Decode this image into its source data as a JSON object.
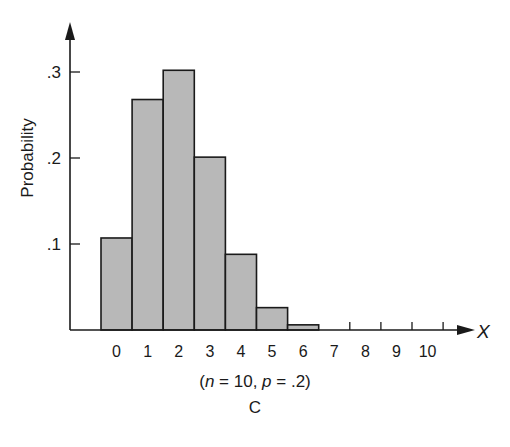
{
  "chart_data": {
    "type": "bar",
    "title": "",
    "xlabel": "X",
    "ylabel": "Probability",
    "categories": [
      "0",
      "1",
      "2",
      "3",
      "4",
      "5",
      "6",
      "7",
      "8",
      "9",
      "10"
    ],
    "values": [
      0.107,
      0.268,
      0.302,
      0.201,
      0.088,
      0.026,
      0.006,
      0.001,
      0.0,
      0.0,
      0.0
    ],
    "yticks": [
      ".1",
      ".2",
      ".3"
    ],
    "ytick_values": [
      0.1,
      0.2,
      0.3
    ],
    "ylim": [
      0,
      0.35
    ],
    "grid": false,
    "legend": null,
    "annotation": "(n = 10, p = .2)",
    "panel_label": "C",
    "bar_color": "#b8b8b8",
    "edge_color": "#1a1a1a"
  },
  "caption": {
    "params_prefix": "(",
    "n_var": "n",
    "n_eq": " = 10, ",
    "p_var": "p",
    "p_eq": " = .2)",
    "panel": "C"
  }
}
